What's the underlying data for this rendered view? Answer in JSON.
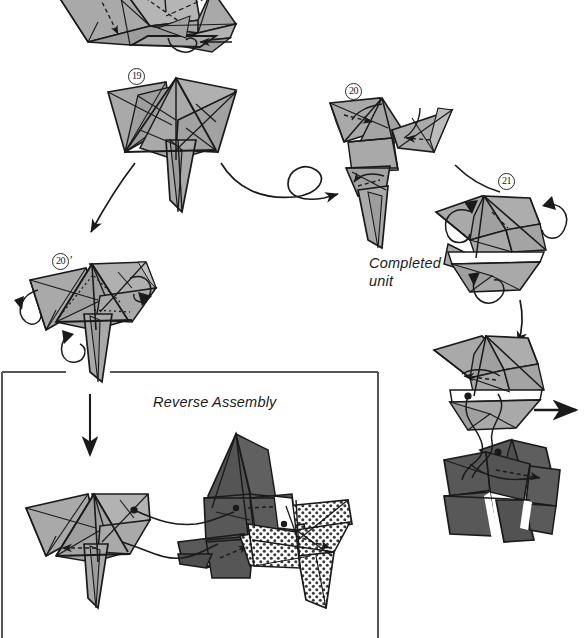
{
  "page": {
    "width": 585,
    "height": 638,
    "background": "#ffffff"
  },
  "palette": {
    "paper_light": "#a9a9a9",
    "paper_light_shade": "#9a9a9a",
    "paper_light_pale": "#bdbdbd",
    "paper_dark": "#585858",
    "paper_dark_shade": "#4a4a4a",
    "paper_white": "#ffffff",
    "ink": "#1a1a1a",
    "dot_pattern": "#3a3a3a",
    "frame": "#555555"
  },
  "steps": [
    {
      "id": "step-19",
      "number": "19",
      "prime": "",
      "label_x": 128,
      "label_y": 68
    },
    {
      "id": "step-20",
      "number": "20",
      "prime": "",
      "label_x": 345,
      "label_y": 83
    },
    {
      "id": "step-21",
      "number": "21",
      "prime": "",
      "label_x": 498,
      "label_y": 173
    },
    {
      "id": "step-20-prime",
      "number": "20",
      "prime": "′",
      "label_x": 52,
      "label_y": 253
    }
  ],
  "captions": [
    {
      "id": "completed-unit",
      "text": "Completed\nunit",
      "x": 369,
      "y": 255
    },
    {
      "id": "reverse-assembly",
      "text": "Reverse Assembly",
      "x": 153,
      "y": 394
    }
  ],
  "frame": {
    "id": "reverse-assembly-frame",
    "x": 2,
    "y": 371,
    "width": 376,
    "height": 267,
    "gap_start_x": 65,
    "gap_end_x": 110
  },
  "figures": [
    {
      "id": "figure-top-partial",
      "name": "partial-unit-top-cutoff",
      "shade": "light",
      "note": "cropped at top edge of page"
    },
    {
      "id": "figure-19",
      "name": "pinwheel-unit-step-19",
      "shade": "light"
    },
    {
      "id": "figure-20",
      "name": "pinwheel-unit-step-20",
      "shade": "light"
    },
    {
      "id": "figure-20-prime",
      "name": "pinwheel-unit-step-20-prime",
      "shade": "light"
    },
    {
      "id": "figure-21",
      "name": "closed-unit-step-21",
      "shade": "light"
    },
    {
      "id": "figure-join-light",
      "name": "join-unit-light",
      "shade": "light"
    },
    {
      "id": "figure-join-dark",
      "name": "join-unit-dark",
      "shade": "dark"
    },
    {
      "id": "figure-assembly-light",
      "name": "reverse-assembly-unit-light",
      "shade": "light"
    },
    {
      "id": "figure-assembly-dark",
      "name": "reverse-assembly-unit-dark",
      "shade": "dark"
    },
    {
      "id": "figure-assembly-dotted",
      "name": "reverse-assembly-unit-dotted",
      "shade": "dotted"
    }
  ],
  "arrows": [
    {
      "id": "arrow-19-to-20-prime",
      "name": "curved-arrow-down-left",
      "type": "curved"
    },
    {
      "id": "arrow-19-to-20",
      "name": "turn-over-loop-arrow",
      "type": "loop"
    },
    {
      "id": "arrow-20-to-21",
      "name": "curved-arrow-right",
      "type": "curved"
    },
    {
      "id": "arrow-21-to-join",
      "name": "curved-arrow-down-right",
      "type": "curved"
    },
    {
      "id": "arrow-20-prime-down",
      "name": "straight-arrow-down",
      "type": "straight"
    },
    {
      "id": "arrow-join-right",
      "name": "straight-arrow-right",
      "type": "straight"
    }
  ]
}
